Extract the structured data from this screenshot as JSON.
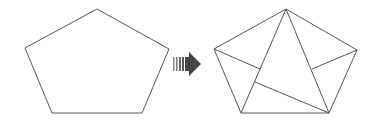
{
  "diagram": {
    "stroke_color": "#555555",
    "arrow_color": "#444444",
    "left_shape": {
      "type": "pentagon",
      "points": [
        [
          97,
          9
        ],
        [
          169,
          49
        ],
        [
          142,
          113
        ],
        [
          52,
          113
        ],
        [
          25,
          48
        ]
      ]
    },
    "arrow": {
      "type": "striped-right-arrow",
      "direction": "right"
    },
    "right_shape": {
      "type": "pentagon-dissected",
      "points": [
        [
          286,
          9
        ],
        [
          357,
          50
        ],
        [
          329,
          113
        ],
        [
          241,
          113
        ],
        [
          214,
          49
        ]
      ],
      "internal_lines": [
        [
          [
            286,
            9
          ],
          [
            241,
            113
          ]
        ],
        [
          [
            286,
            9
          ],
          [
            329,
            113
          ]
        ],
        [
          [
            214,
            49
          ],
          [
            260,
            69
          ]
        ],
        [
          [
            357,
            50
          ],
          [
            312,
            69
          ]
        ],
        [
          [
            255,
            82
          ],
          [
            329,
            113
          ]
        ]
      ]
    }
  }
}
